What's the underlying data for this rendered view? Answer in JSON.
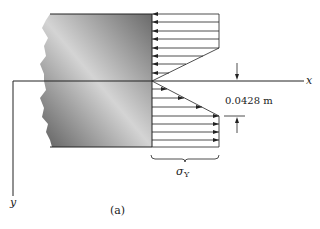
{
  "diagram": {
    "axis_x_label": "x",
    "axis_y_label": "y",
    "dimension_label": "0.0428 m",
    "stress_label_main": "σ",
    "stress_label_sub": "Y",
    "caption": "(a)",
    "colors": {
      "line": "#2a2a2a",
      "block_dark": "#6e6e6e",
      "block_light": "#d8d8d8"
    }
  }
}
